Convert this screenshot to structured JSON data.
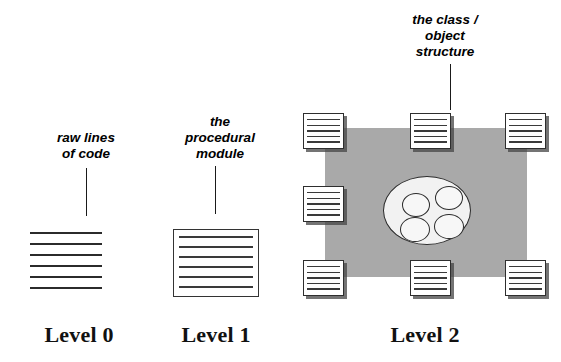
{
  "diagram": {
    "title_absent": true,
    "background_color": "#ffffff",
    "plate_color": "#a9a9a9",
    "ink_color": "#2b2b2b"
  },
  "annotations": [
    {
      "id": "raw-lines-of-code",
      "text": "raw lines\nof code",
      "x": 38,
      "y": 130,
      "width": 96,
      "leader": {
        "x": 86,
        "y": 168,
        "height": 48
      }
    },
    {
      "id": "procedural-module",
      "text": "the\nprocedural\nmodule",
      "x": 168,
      "y": 114,
      "width": 104,
      "leader": {
        "x": 215,
        "y": 166,
        "height": 48
      }
    },
    {
      "id": "class-object-structure",
      "text": "the class /\nobject\nstructure",
      "x": 392,
      "y": 12,
      "width": 106,
      "leader": {
        "x": 450,
        "y": 64,
        "height": 46
      }
    }
  ],
  "levels": [
    {
      "id": "level-0",
      "label": "Level 0",
      "x": 20,
      "y": 322,
      "width": 118
    },
    {
      "id": "level-1",
      "label": "Level 1",
      "x": 157,
      "y": 322,
      "width": 118
    },
    {
      "id": "level-2",
      "label": "Level 2",
      "x": 366,
      "y": 322,
      "width": 118
    }
  ],
  "level0": {
    "id": "raw-lines-of-code-graphic",
    "x": 30,
    "y": 232,
    "line_count": 6,
    "line_width": 72,
    "line_spacing": 11
  },
  "level1": {
    "id": "procedural-module-graphic",
    "x": 173,
    "y": 229,
    "width": 86,
    "height": 68,
    "line_count": 6,
    "line_spacing": 10
  },
  "level2": {
    "plate": {
      "x": 325,
      "y": 128,
      "width": 202,
      "height": 149
    },
    "ellipse": {
      "x": 383,
      "y": 176,
      "width": 88,
      "height": 69
    },
    "inner_circles": [
      {
        "x": 402,
        "y": 193,
        "width": 28,
        "height": 24
      },
      {
        "x": 435,
        "y": 186,
        "width": 28,
        "height": 24
      },
      {
        "x": 400,
        "y": 217,
        "width": 30,
        "height": 25
      },
      {
        "x": 434,
        "y": 214,
        "width": 30,
        "height": 25
      }
    ],
    "modules": [
      {
        "id": "module-top-left",
        "x": 303,
        "y": 113,
        "lines": 5
      },
      {
        "id": "module-top-center",
        "x": 410,
        "y": 113,
        "lines": 5
      },
      {
        "id": "module-top-right",
        "x": 505,
        "y": 113,
        "lines": 5
      },
      {
        "id": "module-mid-left",
        "x": 303,
        "y": 186,
        "lines": 5
      },
      {
        "id": "module-bottom-left",
        "x": 303,
        "y": 260,
        "lines": 5
      },
      {
        "id": "module-bottom-center",
        "x": 410,
        "y": 260,
        "lines": 5
      },
      {
        "id": "module-bottom-right",
        "x": 505,
        "y": 260,
        "lines": 5
      }
    ]
  }
}
